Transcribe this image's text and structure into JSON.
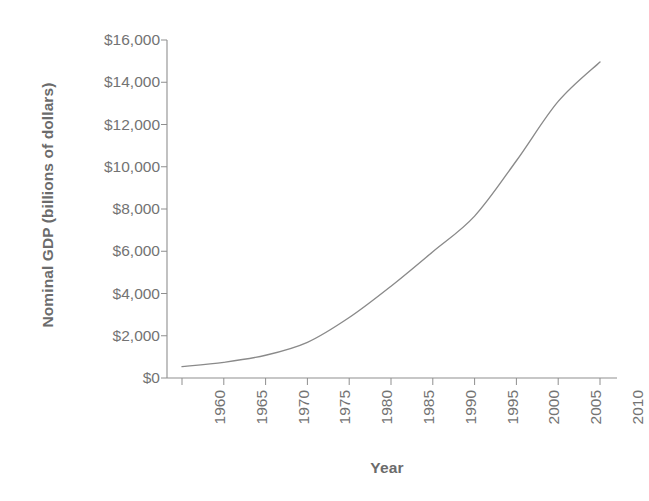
{
  "chart_data": {
    "type": "line",
    "title": "",
    "xlabel": "Year",
    "ylabel": "Nominal GDP (billions of dollars)",
    "x": [
      1960,
      1965,
      1970,
      1975,
      1980,
      1985,
      1990,
      1995,
      2000,
      2005,
      2010
    ],
    "values": [
      540,
      743,
      1076,
      1689,
      2863,
      4347,
      5980,
      7664,
      10285,
      13094,
      14964
    ],
    "series": [
      {
        "name": "Nominal GDP",
        "values": [
          540,
          743,
          1076,
          1689,
          2863,
          4347,
          5980,
          7664,
          10285,
          13094,
          14964
        ]
      }
    ],
    "xlim": [
      1960,
      2010
    ],
    "ylim": [
      0,
      16000
    ],
    "x_tick_labels": [
      "1960",
      "1965",
      "1970",
      "1975",
      "1980",
      "1985",
      "1990",
      "1995",
      "2000",
      "2005",
      "2010"
    ],
    "y_tick_values": [
      0,
      2000,
      4000,
      6000,
      8000,
      10000,
      12000,
      14000,
      16000
    ],
    "y_tick_labels": [
      "$0",
      "$2,000",
      "$4,000",
      "$6,000",
      "$8,000",
      "$10,000",
      "$12,000",
      "$14,000",
      "$16,000"
    ],
    "grid": false,
    "legend": false,
    "legend_position": "none",
    "line_color": "#8a8a8a",
    "axis_color": "#8f8f8f",
    "text_color": "#6f6f6f",
    "background_color": "#ffffff",
    "x_tick_label_rotation": 90,
    "markers": false
  },
  "axes": {
    "y_title": "Nominal GDP (billions of dollars)",
    "x_title": "Year"
  }
}
